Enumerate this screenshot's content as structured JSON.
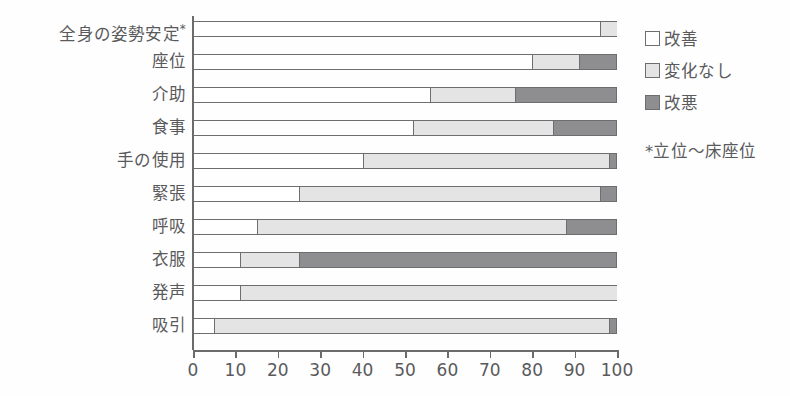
{
  "chart_data": {
    "type": "bar",
    "orientation": "horizontal",
    "stacked": true,
    "stack_mode": "percent",
    "title": "",
    "xlabel": "",
    "ylabel": "",
    "xlim": [
      0,
      100
    ],
    "xticks": [
      0,
      10,
      20,
      30,
      40,
      50,
      60,
      70,
      80,
      90,
      100
    ],
    "xtick_labels": [
      "0",
      "10",
      "20",
      "30",
      "40",
      "50",
      "60",
      "70",
      "80",
      "90",
      "100"
    ],
    "grid": false,
    "legend_position": "right-top",
    "categories": [
      "全身の姿勢安定*",
      "座位",
      "介助",
      "食事",
      "手の使用",
      "緊張",
      "呼吸",
      "衣服",
      "発声",
      "吸引"
    ],
    "series": [
      {
        "name": "改善",
        "color": "#ffffff",
        "values": [
          96,
          80,
          56,
          52,
          40,
          25,
          15,
          11,
          11,
          5
        ]
      },
      {
        "name": "変化なし",
        "color": "#e4e4e4",
        "values": [
          4,
          11,
          20,
          33,
          58,
          71,
          73,
          14,
          89,
          93
        ]
      },
      {
        "name": "改悪",
        "color": "#8e8e90",
        "values": [
          0,
          9,
          24,
          15,
          2,
          4,
          12,
          75,
          0,
          2
        ]
      }
    ],
    "annotations": [
      "*立位〜床座位"
    ]
  },
  "legend": {
    "items": [
      {
        "label": "改善",
        "swatch": "white-swatch"
      },
      {
        "label": "変化なし",
        "swatch": "light-gray-swatch"
      },
      {
        "label": "改悪",
        "swatch": "dark-gray-swatch"
      }
    ],
    "note": "*立位〜床座位"
  },
  "colors": {
    "improve": "#ffffff",
    "no_change": "#e4e4e4",
    "worse": "#8e8e90",
    "outline": "#6e6e70",
    "text": "#5a5a5c"
  }
}
